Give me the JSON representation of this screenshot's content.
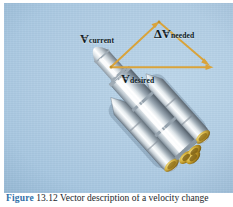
{
  "figure": {
    "domain_type": "vector-diagram",
    "background_color": "#aecbe3",
    "plate": {
      "width": 229,
      "height": 190
    },
    "caption": {
      "figure_number": "Figure",
      "text": "13.12  Vector description of a velocity change"
    }
  },
  "vectors": {
    "arrow_color": "#d9a33a",
    "arrow_color_dark": "#b8821f",
    "items": [
      {
        "name": "v-current",
        "symbol": "V",
        "accent": "→",
        "subscript": "current",
        "from": [
          107,
          64
        ],
        "to": [
          155,
          19
        ]
      },
      {
        "name": "delta-v-needed",
        "prefix": "Δ",
        "symbol": "V",
        "accent": "→",
        "subscript": "needed",
        "from": [
          155,
          19
        ],
        "to": [
          205,
          62
        ]
      },
      {
        "name": "v-desired",
        "symbol": "V",
        "accent": "→",
        "subscript": "desired",
        "from": [
          107,
          64
        ],
        "to": [
          209,
          64
        ]
      }
    ]
  },
  "rocket": {
    "name": "launch-vehicle",
    "body_color": "#e9eef2",
    "shadow_color": "#7d8a95",
    "nozzle_color": "#c8a227",
    "orientation_degrees": -42
  }
}
